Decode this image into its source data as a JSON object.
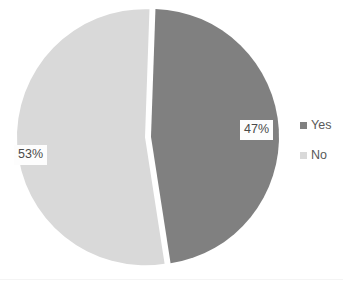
{
  "chart_data": {
    "type": "pie",
    "title": "",
    "subtitle": "",
    "xlabel": "",
    "ylabel": "",
    "categories": [
      "Yes",
      "No"
    ],
    "values": [
      47,
      53
    ],
    "value_unit": "%",
    "data_labels": [
      "47%",
      "53%"
    ],
    "slice_colors": [
      "#808080",
      "#d9d9d9"
    ],
    "legend": {
      "position": "right",
      "entries": [
        {
          "label": "Yes",
          "color": "#808080",
          "value": 47,
          "data_label": "47%"
        },
        {
          "label": "No",
          "color": "#d9d9d9",
          "value": 53,
          "data_label": "53%"
        }
      ]
    },
    "grid": false,
    "exploded": true,
    "start_angle_deg": 2,
    "background": "#ffffff"
  },
  "geometry": {
    "center_x": 148,
    "center_y": 137,
    "radius": 128,
    "explode_offset": 3
  }
}
